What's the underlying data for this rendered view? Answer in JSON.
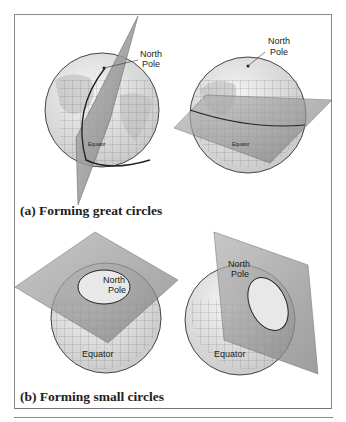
{
  "figure": {
    "panel_a": {
      "caption": "(a) Forming great circles",
      "left_globe": {
        "pole_label_line1": "North",
        "pole_label_line2": "Pole",
        "equator_label": "Equator"
      },
      "right_globe": {
        "pole_label_line1": "North",
        "pole_label_line2": "Pole",
        "equator_label": "Equator"
      }
    },
    "panel_b": {
      "caption": "(b) Forming small circles",
      "left_globe": {
        "pole_label_line1": "North",
        "pole_label_line2": "Pole",
        "equator_label": "Equator"
      },
      "right_globe": {
        "pole_label_line1": "North",
        "pole_label_line2": "Pole",
        "equator_label": "Equator"
      }
    }
  },
  "colors": {
    "plane": "#9a9a9a",
    "globe_fill": "#e4e4e4",
    "land": "#b8b8b8",
    "grid": "#555555",
    "frame": "#8a8a8a"
  }
}
